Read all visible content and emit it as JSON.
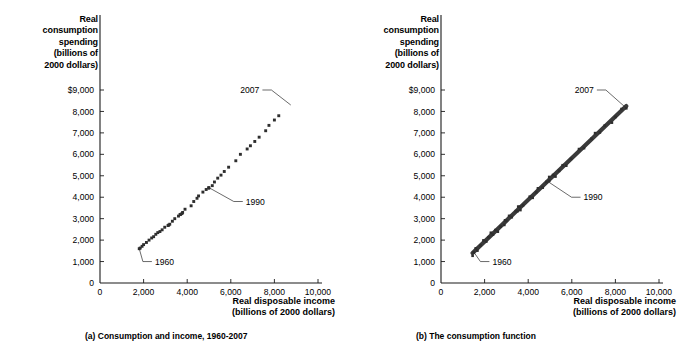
{
  "figure": {
    "panels": [
      {
        "id": "a",
        "caption": "(a) Consumption and income, 1960-2007",
        "y_axis_title": [
          "Real",
          "consumption",
          "spending",
          "(billions of",
          "2000 dollars)"
        ],
        "x_axis_title": [
          "Real disposable income",
          "(billions of 2000 dollars)"
        ]
      },
      {
        "id": "b",
        "caption": "(b)  The consumption function",
        "y_axis_title": [
          "Real",
          "consumption",
          "spending",
          "(billions of",
          "2000 dollars)"
        ],
        "x_axis_title": [
          "Real disposable income",
          "(billions of 2000 dollars)"
        ]
      }
    ],
    "annotations": {
      "start_year": "1960",
      "mid_year": "1990",
      "end_year": "2007"
    },
    "colors": {
      "marker": "#2e2e2e",
      "line": "#3a3a3a",
      "axis": "#1a1a1a",
      "text": "#000000",
      "background": "#ffffff"
    }
  },
  "chart_data": [
    {
      "type": "scatter",
      "title": "(a) Consumption and income, 1960-2007",
      "xlabel": "Real disposable income (billions of 2000 dollars)",
      "ylabel": "Real consumption spending (billions of 2000 dollars)",
      "xlim": [
        0,
        10000
      ],
      "ylim": [
        0,
        9000
      ],
      "xticks": [
        0,
        2000,
        4000,
        6000,
        8000,
        10000
      ],
      "xticklabels": [
        "0",
        "2,000",
        "4,000",
        "6,000",
        "8,000",
        "10,000"
      ],
      "yticks": [
        0,
        1000,
        2000,
        3000,
        4000,
        5000,
        6000,
        7000,
        8000,
        9000
      ],
      "yticklabels": [
        "0",
        "1,000",
        "2,000",
        "3,000",
        "4,000",
        "5,000",
        "6,000",
        "7,000",
        "8,000",
        "$9,000"
      ],
      "grid": false,
      "legend": "none",
      "series": [
        {
          "name": "Consumption vs. disposable income, 1960-2007",
          "years": [
            1960,
            1961,
            1962,
            1963,
            1964,
            1965,
            1966,
            1967,
            1968,
            1969,
            1970,
            1971,
            1972,
            1973,
            1974,
            1975,
            1976,
            1977,
            1978,
            1979,
            1980,
            1981,
            1982,
            1983,
            1984,
            1985,
            1986,
            1987,
            1988,
            1989,
            1990,
            1991,
            1992,
            1993,
            1994,
            1995,
            1996,
            1997,
            1998,
            1999,
            2000,
            2001,
            2002,
            2003,
            2004,
            2005,
            2006,
            2007
          ],
          "x": [
            1800,
            1845,
            1930,
            2000,
            2130,
            2250,
            2370,
            2460,
            2560,
            2650,
            2750,
            2850,
            2970,
            3150,
            3120,
            3200,
            3320,
            3430,
            3600,
            3700,
            3670,
            3760,
            3790,
            3900,
            4180,
            4300,
            4450,
            4520,
            4720,
            4870,
            4990,
            4990,
            5150,
            5250,
            5400,
            5550,
            5700,
            5900,
            6230,
            6440,
            6750,
            6900,
            7100,
            7300,
            7600,
            7750,
            8000,
            8200
          ],
          "y": [
            1600,
            1630,
            1710,
            1790,
            1890,
            2000,
            2100,
            2160,
            2270,
            2350,
            2400,
            2480,
            2600,
            2700,
            2680,
            2740,
            2880,
            3000,
            3120,
            3200,
            3190,
            3240,
            3290,
            3440,
            3600,
            3800,
            3950,
            4060,
            4240,
            4360,
            4450,
            4420,
            4540,
            4710,
            4890,
            5030,
            5200,
            5400,
            5700,
            6000,
            6250,
            6400,
            6600,
            6800,
            7100,
            7350,
            7600,
            7800
          ],
          "marker": "square"
        }
      ],
      "annotations": [
        {
          "label": "1960",
          "points_to_x": 1800,
          "points_to_y": 1600
        },
        {
          "label": "1990",
          "points_to_x": 4990,
          "points_to_y": 4450
        },
        {
          "label": "2007",
          "points_to_x": 8750,
          "points_to_y": 8300
        }
      ]
    },
    {
      "type": "scatter",
      "title": "(b)  The consumption function",
      "xlabel": "Real disposable income (billions of 2000 dollars)",
      "ylabel": "Real consumption spending (billions of 2000 dollars)",
      "xlim": [
        0,
        10000
      ],
      "ylim": [
        0,
        9000
      ],
      "xticks": [
        0,
        2000,
        4000,
        6000,
        8000,
        10000
      ],
      "xticklabels": [
        "0",
        "2,000",
        "4,000",
        "6,000",
        "8,000",
        "10,000"
      ],
      "yticks": [
        0,
        1000,
        2000,
        3000,
        4000,
        5000,
        6000,
        7000,
        8000,
        9000
      ],
      "yticklabels": [
        "0",
        "1,000",
        "2,000",
        "3,000",
        "4,000",
        "5,000",
        "6,000",
        "7,000",
        "8,000",
        "$9,000"
      ],
      "grid": false,
      "legend": "none",
      "series": [
        {
          "name": "Consumption function (fitted line through 1960-2007 data)",
          "line_from": {
            "x": 1450,
            "y": 1400
          },
          "line_to": {
            "x": 8500,
            "y": 8250
          },
          "slope": 0.97,
          "intercept": -7,
          "style": "thick-line"
        }
      ],
      "annotations": [
        {
          "label": "1960",
          "points_to_x": 1500,
          "points_to_y": 1450
        },
        {
          "label": "1990",
          "points_to_x": 4950,
          "points_to_y": 4700
        },
        {
          "label": "2007",
          "points_to_x": 8450,
          "points_to_y": 8200
        }
      ]
    }
  ]
}
